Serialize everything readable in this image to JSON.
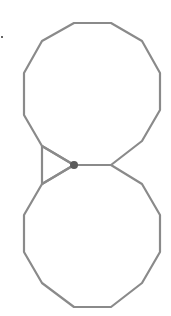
{
  "diagram": {
    "stroke_color": "#8a8a8a",
    "dot_color": "#5a5a5a",
    "stroke_width": 2.2,
    "top_polygon": [
      [
        74,
        23
      ],
      [
        111,
        23
      ],
      [
        142,
        41
      ],
      [
        160,
        73
      ],
      [
        160,
        110
      ],
      [
        142,
        141
      ],
      [
        111,
        165
      ],
      [
        74,
        165
      ],
      [
        42,
        146
      ],
      [
        24,
        115
      ],
      [
        24,
        73
      ],
      [
        42,
        41
      ]
    ],
    "bottom_polygon": [
      [
        111,
        165
      ],
      [
        142,
        184
      ],
      [
        160,
        215
      ],
      [
        160,
        252
      ],
      [
        142,
        283
      ],
      [
        111,
        307
      ],
      [
        74,
        307
      ],
      [
        42,
        283
      ],
      [
        24,
        252
      ],
      [
        24,
        215
      ],
      [
        42,
        184
      ],
      [
        74,
        165
      ]
    ],
    "triangle": [
      [
        42,
        146
      ],
      [
        74,
        165
      ],
      [
        42,
        184
      ]
    ],
    "connector_edge": [
      [
        74,
        165
      ],
      [
        111,
        165
      ]
    ],
    "highlight_vertex": {
      "x": 74,
      "y": 165,
      "r": 4
    },
    "corner_mark": {
      "x": 2,
      "y": 37
    }
  }
}
